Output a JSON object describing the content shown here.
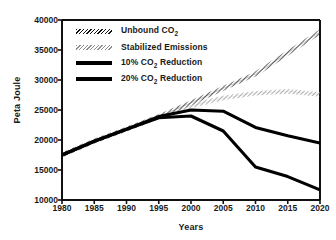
{
  "chart_data": {
    "type": "line",
    "title": "",
    "xlabel": "Years",
    "ylabel": "Peta Joule",
    "x": [
      1980,
      1985,
      1990,
      1995,
      2000,
      2005,
      2010,
      2015,
      2020
    ],
    "xticklabels": [
      "1980",
      "1985",
      "1990",
      "1995",
      "2000",
      "2005",
      "2010",
      "2015",
      "2020"
    ],
    "yticklabels": [
      "10000",
      "15000",
      "20000",
      "25000",
      "30000",
      "35000",
      "40000"
    ],
    "yticks": [
      10000,
      15000,
      20000,
      25000,
      30000,
      35000,
      40000
    ],
    "xlim": [
      1980,
      2020
    ],
    "ylim": [
      10000,
      40000
    ],
    "grid": false,
    "legend_position": "upper-left-inside",
    "series": [
      {
        "name": "Unbound CO2",
        "label": "Unbound CO",
        "label_sub": "2",
        "style": "hatched-dark",
        "color": "#111111",
        "values": [
          17500,
          19800,
          21800,
          23900,
          26200,
          28600,
          31000,
          34500,
          38000
        ]
      },
      {
        "name": "Stabilized Emissions",
        "label": "Stabilized Emissions",
        "label_sub": "",
        "style": "hatched-gray",
        "color": "#8d8d8d",
        "values": [
          17500,
          19800,
          21800,
          23900,
          25700,
          27000,
          27800,
          28100,
          27600
        ]
      },
      {
        "name": "10% CO2 Reduction",
        "label": "10% CO",
        "label_sub": "2",
        "label_tail": " Reduction",
        "style": "solid",
        "color": "#000000",
        "values": [
          17500,
          19800,
          21800,
          23900,
          25000,
          24800,
          22100,
          20700,
          19500
        ]
      },
      {
        "name": "20% CO2 Reduction",
        "label": "20% CO",
        "label_sub": "2",
        "label_tail": " Reduction",
        "style": "solid",
        "color": "#000000",
        "values": [
          17500,
          19800,
          21800,
          23700,
          24000,
          21500,
          15500,
          13900,
          11700
        ]
      }
    ]
  }
}
